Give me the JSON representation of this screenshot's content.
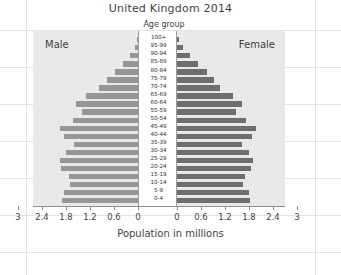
{
  "chart_title": "United Kingdom 2014",
  "top_axis_caption": "Age group",
  "left_side_label": "Male",
  "right_side_label": "Female",
  "xaxis_title": "Population in millions",
  "colors": {
    "panel_background": "#e9e9e9",
    "male_bar": "#969696",
    "female_bar": "#6e6e6e",
    "axis": "#8d8d8d",
    "text": "#3f3f3f",
    "page_background": "#ffffff",
    "rule_line": "#dfe3ea"
  },
  "xaxis_tick_labels": [
    "3",
    "2.4",
    "1.8",
    "1.2",
    "0.6",
    "0",
    "0",
    "0.6",
    "1.2",
    "1.8",
    "2.4",
    "3"
  ],
  "chart_data": {
    "type": "bar",
    "subtype": "population-pyramid",
    "title": "United Kingdom 2014",
    "xlabel": "Population in millions",
    "ylabel": "Age group",
    "xlim": [
      0,
      3
    ],
    "grid": false,
    "legend": [
      "Male",
      "Female"
    ],
    "legend_position": "inside-top-corners",
    "orientation": "horizontal",
    "categories": [
      "100+",
      "95-99",
      "90-94",
      "85-89",
      "80-84",
      "75-79",
      "70-74",
      "65-69",
      "60-64",
      "55-59",
      "50-54",
      "45-49",
      "40-44",
      "35-39",
      "30-34",
      "25-29",
      "20-24",
      "15-19",
      "10-14",
      "5-9",
      "0-4"
    ],
    "series": [
      {
        "name": "Male",
        "side": "left",
        "values": [
          0.02,
          0.08,
          0.2,
          0.37,
          0.58,
          0.78,
          0.98,
          1.3,
          1.55,
          1.4,
          1.62,
          1.95,
          1.85,
          1.6,
          1.8,
          1.95,
          1.92,
          1.72,
          1.7,
          1.85,
          1.9
        ]
      },
      {
        "name": "Female",
        "side": "right",
        "values": [
          0.04,
          0.14,
          0.32,
          0.53,
          0.75,
          0.93,
          1.08,
          1.4,
          1.62,
          1.48,
          1.72,
          1.98,
          1.88,
          1.62,
          1.8,
          1.9,
          1.85,
          1.7,
          1.65,
          1.8,
          1.83
        ]
      }
    ]
  }
}
